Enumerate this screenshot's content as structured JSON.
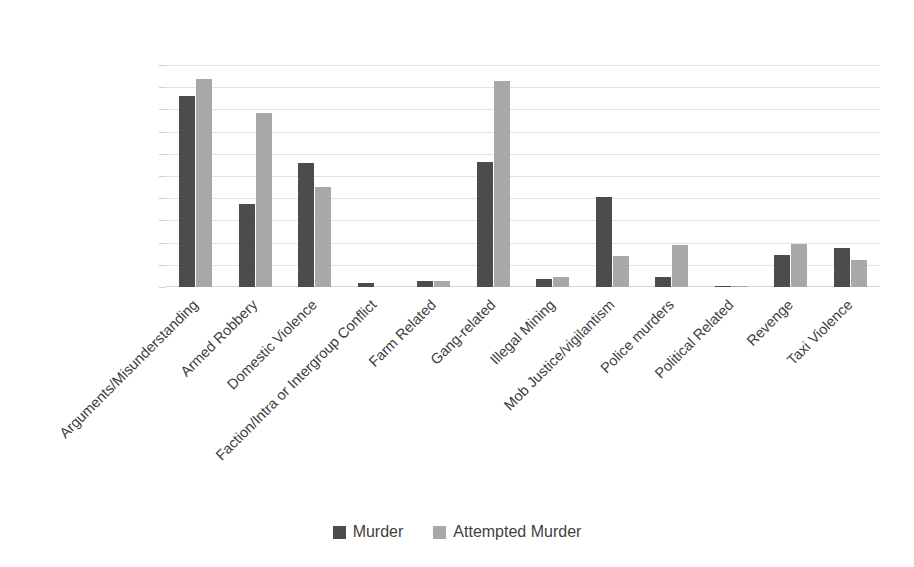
{
  "chart_data": {
    "type": "bar",
    "title": "",
    "xlabel": "",
    "ylabel": "",
    "ylim": [
      0,
      2000
    ],
    "ytick_step": 200,
    "grid": true,
    "legend_position": "bottom",
    "categories": [
      "Arguments/Misunderstanding",
      "Armed Robbery",
      "Domestic Violence",
      "Faction/Intra or Intergroup Conflict",
      "Farm Related",
      "Gang-related",
      "Illegal Mining",
      "Mob Justice/vigilantism",
      "Police murders",
      "Political Related",
      "Revenge",
      "Taxi Violence"
    ],
    "yticks": [
      "0",
      "200",
      "400",
      "600",
      "800",
      "1000",
      "1200",
      "1400",
      "1600",
      "1800",
      "2000"
    ],
    "series": [
      {
        "name": "Murder",
        "color": "#4c4c4c",
        "values": [
          1720,
          750,
          1120,
          40,
          50,
          1130,
          70,
          810,
          90,
          10,
          290,
          350
        ]
      },
      {
        "name": "Attempted Murder",
        "color": "#a8a8a8",
        "values": [
          1870,
          1570,
          900,
          0,
          50,
          1860,
          90,
          280,
          380,
          10,
          390,
          240
        ]
      }
    ]
  },
  "legend": {
    "items": [
      {
        "label": "Murder",
        "color": "#4c4c4c"
      },
      {
        "label": "Attempted Murder",
        "color": "#a8a8a8"
      }
    ]
  },
  "colors": {
    "murder": "#4c4c4c",
    "attempted_murder": "#a8a8a8",
    "gridline": "#e2e2e2",
    "text": "#3f3f3f",
    "background": "#ffffff"
  }
}
